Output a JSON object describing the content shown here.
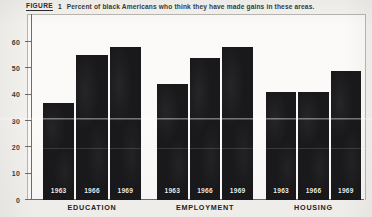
{
  "caption": {
    "figure_label": "FIGURE",
    "figure_number": "1",
    "text": "Percent of black Americans who think they have made gains in these areas."
  },
  "chart_data": {
    "type": "bar",
    "title": "Percent of black Americans who think they have made gains in these areas.",
    "xlabel": "",
    "ylabel": "",
    "ylim": [
      0,
      65
    ],
    "yticks": [
      0,
      10,
      20,
      30,
      40,
      50,
      60
    ],
    "ytick_labels": [
      "0",
      "10",
      "20",
      "30",
      "40",
      "50",
      "60"
    ],
    "grid": false,
    "legend": "none",
    "categories": [
      "EDUCATION",
      "EMPLOYMENT",
      "HOUSING"
    ],
    "series": [
      {
        "name": "1963",
        "values": [
          37,
          44,
          41
        ]
      },
      {
        "name": "1966",
        "values": [
          55,
          54,
          41
        ]
      },
      {
        "name": "1969",
        "values": [
          58,
          58,
          49
        ]
      }
    ],
    "bar_labels_inside": [
      "1963",
      "1966",
      "1969"
    ],
    "bar_color": "#19181a"
  }
}
